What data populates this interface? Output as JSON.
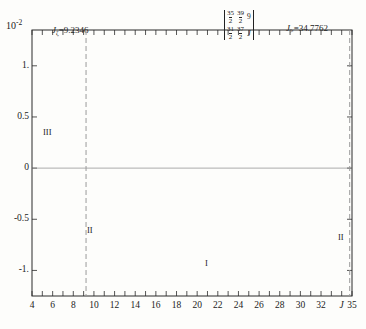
{
  "figure": {
    "y_axis_multiplier": "10",
    "y_axis_exponent": "-2",
    "y_ticks": [
      "1.",
      "0.5",
      "0",
      "-0.5",
      "-1."
    ],
    "x_axis_symbol": "J",
    "left_turning_point_label": "J",
    "left_turning_point_sub": "ζ",
    "left_turning_point_value": "=9.2346",
    "right_turning_point_label": "J",
    "right_turning_point_sub": ">",
    "right_turning_point_value": "=34.7762",
    "sixj": {
      "row1": [
        "35/2",
        "39/2",
        "9"
      ],
      "row2": [
        "31/2",
        "37/2",
        "J"
      ],
      "c1_num": "35",
      "c1_den": "2",
      "c2_num": "39",
      "c2_den": "2",
      "c3_top": "9",
      "c4_num": "31",
      "c4_den": "2",
      "c5_num": "37",
      "c5_den": "2",
      "c6_bot": "J"
    },
    "region_I": "I",
    "region_II_left": "II",
    "region_II_right": "II",
    "region_III": "III"
  },
  "chart_data": {
    "type": "line",
    "title": "",
    "xlabel": "J",
    "ylabel": "",
    "y_scale_factor": 0.01,
    "y_scale_label": "10^-2",
    "xlim": [
      4,
      35
    ],
    "ylim": [
      -1.25,
      1.35
    ],
    "grid": false,
    "legend": false,
    "x_ticks": [
      4,
      5,
      6,
      7,
      8,
      9,
      10,
      11,
      12,
      13,
      14,
      15,
      16,
      17,
      18,
      19,
      20,
      21,
      22,
      23,
      24,
      25,
      26,
      27,
      28,
      29,
      30,
      31,
      32,
      33,
      34,
      35
    ],
    "x_tick_labels": [
      "4",
      "",
      "6",
      "",
      "8",
      "",
      "10",
      "",
      "12",
      "",
      "14",
      "",
      "16",
      "",
      "18",
      "",
      "20",
      "",
      "22",
      "",
      "24",
      "",
      "26",
      "",
      "28",
      "",
      "30",
      "",
      "32",
      "",
      "J",
      "35"
    ],
    "y_ticks": [
      -1,
      -0.5,
      0,
      0.5,
      1
    ],
    "annotations": [
      {
        "text": "J_zeta = 9.2346",
        "x": 9.2346,
        "type": "vertical-dashed-line"
      },
      {
        "text": "J_> = 34.7762",
        "x": 34.7762,
        "type": "vertical-dashed-line"
      },
      {
        "text": "I",
        "x": 21.0,
        "y": -1.12
      },
      {
        "text": "II",
        "x": 10.3,
        "y": -0.72
      },
      {
        "text": "II",
        "x": 33.6,
        "y": -0.63
      },
      {
        "text": "III",
        "x": 6.0,
        "y": 0.42
      }
    ],
    "series": [
      {
        "name": "6-j symbol value",
        "marker": "open-circle",
        "x": [
          4,
          5,
          6,
          7,
          8,
          9,
          10,
          11,
          12,
          13,
          14,
          15,
          16,
          17,
          18,
          19,
          20,
          21,
          22,
          23,
          24,
          25,
          26,
          27,
          28,
          29,
          30,
          31,
          32,
          33,
          34,
          35
        ],
        "values": [
          0.02,
          -0.08,
          0.22,
          -0.35,
          0.46,
          -0.7,
          0.86,
          -1.08,
          1.17,
          -0.88,
          0.82,
          -0.6,
          0.73,
          -0.43,
          0.79,
          -0.33,
          0.8,
          -0.26,
          0.79,
          -0.23,
          0.82,
          -0.27,
          0.75,
          -0.38,
          0.72,
          -0.59,
          0.9,
          -1.05,
          0.97,
          -1.12,
          -0.5,
          0.0
        ]
      }
    ]
  }
}
